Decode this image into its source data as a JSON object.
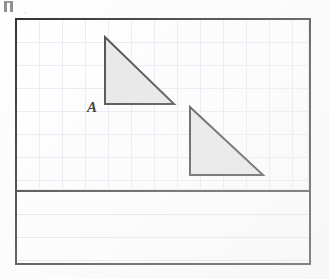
{
  "page": {
    "kind": "scanned-geometry-worksheet",
    "background_color": "#fefefe",
    "width": 329,
    "height": 279
  },
  "corner_artifact": {
    "name": "staple-mark",
    "visible": true
  },
  "figure_frame": {
    "border_color": "#2e2e2e",
    "border_width": 2,
    "x": 15,
    "y": 18,
    "width": 296,
    "height": 247
  },
  "graph_region": {
    "grid_color": "#c9d6e6",
    "grid_spacing": 23,
    "height": 170
  },
  "divider": {
    "color": "#3a3a3a",
    "y": 170,
    "thickness": 2
  },
  "ruled_region": {
    "rule_color": "#e6e6e6",
    "rule_spacing": 23,
    "line_count": 3
  },
  "labels": {
    "triangle_a": "A"
  },
  "chart_data": {
    "type": "scatter",
    "title": "",
    "xlabel": "",
    "ylabel": "",
    "grid": true,
    "legend": "none",
    "fill_color": "#e6e6e6",
    "stroke_color": "#3a3a3a",
    "shapes": [
      {
        "name": "triangle-a",
        "label": "A",
        "type": "right-triangle",
        "points": [
          [
            88,
            17
          ],
          [
            88,
            84
          ],
          [
            157,
            84
          ]
        ],
        "right_angle_at": [
          88,
          84
        ],
        "legs": {
          "vertical": 67,
          "horizontal": 69
        }
      },
      {
        "name": "triangle-b",
        "label": "",
        "type": "right-triangle",
        "points": [
          [
            173,
            87
          ],
          [
            173,
            155
          ],
          [
            246,
            155
          ]
        ],
        "right_angle_at": [
          173,
          155
        ],
        "legs": {
          "vertical": 68,
          "horizontal": 73
        }
      }
    ]
  }
}
